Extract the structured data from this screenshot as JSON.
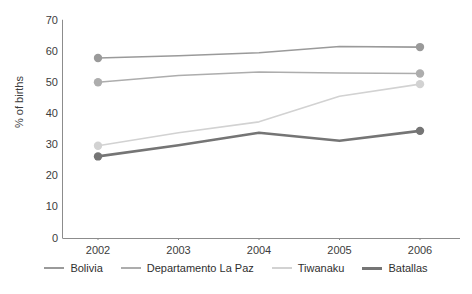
{
  "chart_data": {
    "type": "line",
    "title": "",
    "xlabel": "",
    "ylabel": "% of births",
    "categories": [
      "2002",
      "2003",
      "2004",
      "2005",
      "2006"
    ],
    "ylim": [
      0,
      70
    ],
    "yticks": [
      0,
      10,
      20,
      30,
      40,
      50,
      60,
      70
    ],
    "grid": false,
    "legend_position": "bottom",
    "markers_at": [
      "2002",
      "2006"
    ],
    "series": [
      {
        "name": "Bolivia",
        "color": "#9a9a9a",
        "width": 1.6,
        "values": [
          57.8,
          58.5,
          59.5,
          61.5,
          61.3
        ]
      },
      {
        "name": "Departamento La Paz",
        "color": "#adadad",
        "width": 1.6,
        "values": [
          50.0,
          52.2,
          53.3,
          53.0,
          52.8
        ]
      },
      {
        "name": "Tiwanaku",
        "color": "#d2d2d2",
        "width": 1.6,
        "values": [
          29.6,
          33.8,
          37.3,
          45.5,
          49.4
        ]
      },
      {
        "name": "Batallas",
        "color": "#757575",
        "width": 2.6,
        "values": [
          26.2,
          29.8,
          33.8,
          31.2,
          34.4
        ]
      }
    ]
  },
  "axis": {
    "axis_color": "#8c8c8c",
    "tick_color": "#8c8c8c"
  },
  "yticklabels": [
    "70",
    "60",
    "50",
    "40",
    "30",
    "20",
    "10",
    "0"
  ],
  "xticklabels": [
    "2002",
    "2003",
    "2004",
    "2005",
    "2006"
  ],
  "legend": {
    "items": [
      {
        "label": "Bolivia",
        "color": "#9a9a9a",
        "width": "2px"
      },
      {
        "label": "Departamento La Paz",
        "color": "#adadad",
        "width": "2px"
      },
      {
        "label": "Tiwanaku",
        "color": "#d2d2d2",
        "width": "2px"
      },
      {
        "label": "Batallas",
        "color": "#757575",
        "width": "3px"
      }
    ]
  }
}
